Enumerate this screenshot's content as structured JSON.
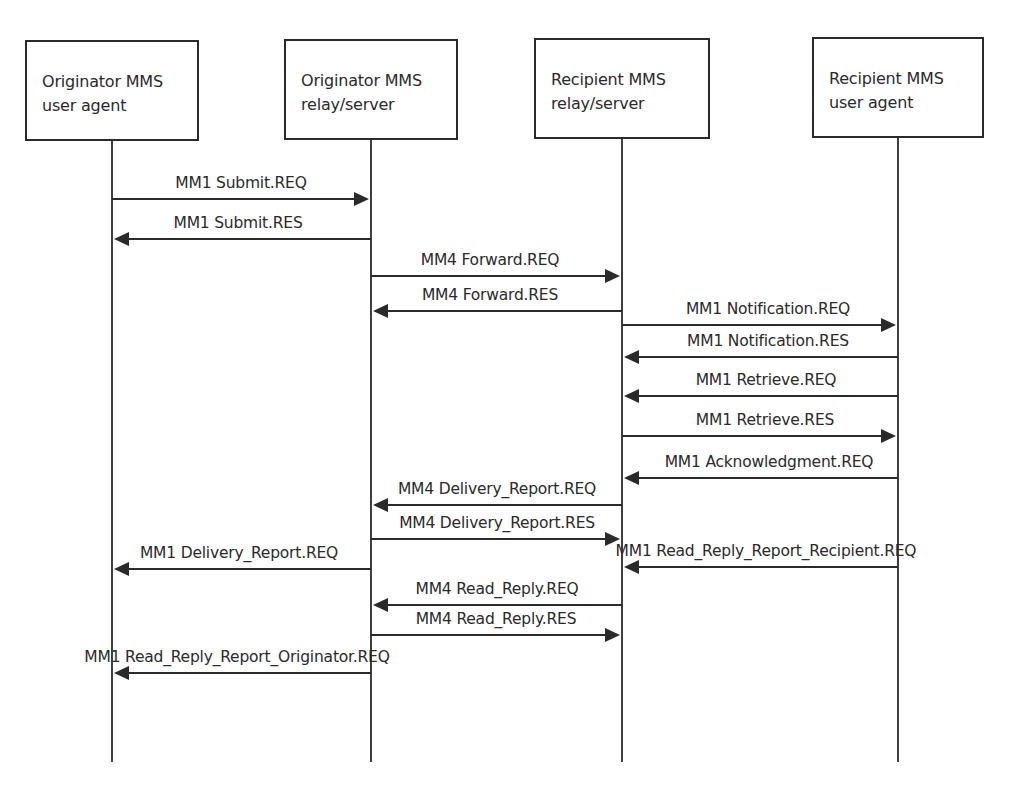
{
  "diagram": {
    "type": "sequence-diagram",
    "participants": [
      {
        "id": "orig_ua",
        "label": "Originator MMS\nuser agent",
        "box": {
          "x": 25,
          "y": 40,
          "w": 174,
          "h": 101
        },
        "lifeline_x": 112
      },
      {
        "id": "orig_rs",
        "label": "Originator MMS\nrelay/server",
        "box": {
          "x": 284,
          "y": 39,
          "w": 174,
          "h": 101
        },
        "lifeline_x": 371
      },
      {
        "id": "recip_rs",
        "label": "Recipient MMS\nrelay/server",
        "box": {
          "x": 534,
          "y": 38,
          "w": 176,
          "h": 101
        },
        "lifeline_x": 622
      },
      {
        "id": "recip_ua",
        "label": "Recipient MMS\nuser agent",
        "box": {
          "x": 812,
          "y": 37,
          "w": 172,
          "h": 101
        },
        "lifeline_x": 898
      }
    ],
    "lifeline_end_y": 762,
    "messages": [
      {
        "label": "MM1 Submit.REQ",
        "from": "orig_ua",
        "to": "orig_rs",
        "y": 199,
        "label_x": 241
      },
      {
        "label": "MM1 Submit.RES",
        "from": "orig_rs",
        "to": "orig_ua",
        "y": 239,
        "label_x": 238
      },
      {
        "label": "MM4 Forward.REQ",
        "from": "orig_rs",
        "to": "recip_rs",
        "y": 276,
        "label_x": 490
      },
      {
        "label": "MM4 Forward.RES",
        "from": "recip_rs",
        "to": "orig_rs",
        "y": 311,
        "label_x": 490
      },
      {
        "label": "MM1 Notification.REQ",
        "from": "recip_rs",
        "to": "recip_ua",
        "y": 325,
        "label_x": 768
      },
      {
        "label": "MM1 Notification.RES",
        "from": "recip_ua",
        "to": "recip_rs",
        "y": 357,
        "label_x": 768
      },
      {
        "label": "MM1 Retrieve.REQ",
        "from": "recip_ua",
        "to": "recip_rs",
        "y": 396,
        "label_x": 766
      },
      {
        "label": "MM1 Retrieve.RES",
        "from": "recip_rs",
        "to": "recip_ua",
        "y": 436,
        "label_x": 765
      },
      {
        "label": "MM1 Acknowledgment.REQ",
        "from": "recip_ua",
        "to": "recip_rs",
        "y": 478,
        "label_x": 769
      },
      {
        "label": "MM4 Delivery_Report.REQ",
        "from": "recip_rs",
        "to": "orig_rs",
        "y": 505,
        "label_x": 497
      },
      {
        "label": "MM4 Delivery_Report.RES",
        "from": "orig_rs",
        "to": "recip_rs",
        "y": 539,
        "label_x": 497
      },
      {
        "label": "MM1 Delivery_Report.REQ",
        "from": "orig_rs",
        "to": "orig_ua",
        "y": 569,
        "label_x": 239
      },
      {
        "label": "MM1 Read_Reply_Report_Recipient.REQ",
        "from": "recip_ua",
        "to": "recip_rs",
        "y": 567,
        "label_x": 766
      },
      {
        "label": "MM4 Read_Reply.REQ",
        "from": "recip_rs",
        "to": "orig_rs",
        "y": 605,
        "label_x": 497
      },
      {
        "label": "MM4 Read_Reply.RES",
        "from": "orig_rs",
        "to": "recip_rs",
        "y": 635,
        "label_x": 496
      },
      {
        "label": "MM1 Read_Reply_Report_Originator.REQ",
        "from": "orig_rs",
        "to": "orig_ua",
        "y": 673,
        "label_x": 237
      }
    ],
    "colors": {
      "line": "#2a2a2a",
      "text": "#2a2a2a",
      "background": "#ffffff"
    }
  }
}
